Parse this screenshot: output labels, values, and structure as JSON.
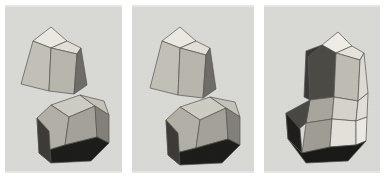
{
  "figure": {
    "panel_count": 3,
    "background_color": "#d9d9d6",
    "page_color": "#ffffff",
    "edge_color": "#54534f",
    "palette": {
      "white_face": "#ece9e3",
      "light_face": "#d3d0c9",
      "mid_face": "#b4b1a9",
      "mid_dark_face": "#97948c",
      "dark_face": "#5e5c57",
      "darkest_face": "#1a1a19",
      "shadow_face": "#2b2a27",
      "highlight_face": "#f2efe9"
    },
    "panels": [
      {
        "id": "panel-1",
        "label": "panel-a",
        "caption": "",
        "solids": [
          "pentagonal-cupola",
          "rhombic-solid"
        ],
        "arrangement": "separated"
      },
      {
        "id": "panel-2",
        "label": "panel-b",
        "caption": "",
        "solids": [
          "pentagonal-cupola",
          "rhombic-solid"
        ],
        "arrangement": "touching"
      },
      {
        "id": "panel-3",
        "label": "panel-c",
        "caption": "",
        "solids": [
          "fused-polyhedron"
        ],
        "arrangement": "merged"
      }
    ]
  }
}
